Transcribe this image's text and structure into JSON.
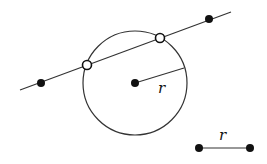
{
  "diagram": {
    "radius_label": "r",
    "segment_label": "r",
    "colors": {
      "stroke": "#222222",
      "fill": "#111111",
      "background": "#ffffff"
    }
  }
}
